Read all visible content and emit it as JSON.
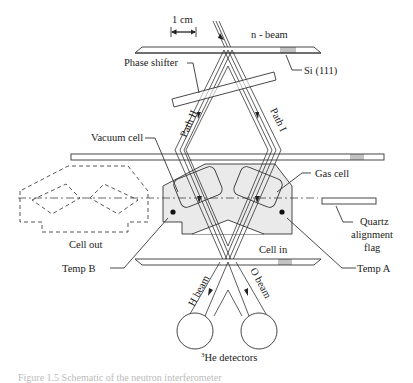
{
  "diagram": {
    "labels": {
      "scale": "1 cm",
      "n_beam": "n - beam",
      "si": "Si (111)",
      "phase_shifter": "Phase shifter",
      "path_two": "Path II",
      "path_one": "Path I",
      "vacuum_cell": "Vacuum cell",
      "gas_cell": "Gas cell",
      "cell_out": "Cell out",
      "cell_in": "Cell in",
      "quartz": [
        "Quartz",
        "alignment",
        "flag"
      ],
      "temp_b": "Temp B",
      "temp_a": "Temp A",
      "h_beam": "H beam",
      "o_beam": "O beam",
      "detectors_sup": "3",
      "detectors": "He detectors"
    },
    "caption": "Figure 1.5 Schematic of the neutron interferometer"
  }
}
